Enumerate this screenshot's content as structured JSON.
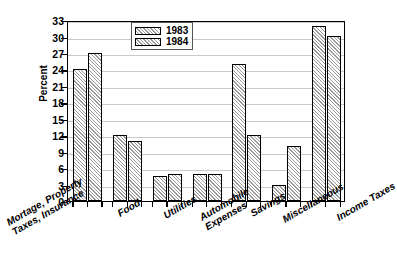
{
  "chart_data": {
    "type": "bar",
    "title": "",
    "xlabel": "",
    "ylabel": "Percent",
    "ylim": [
      0,
      33
    ],
    "yticks": [
      0,
      3,
      6,
      9,
      12,
      15,
      18,
      21,
      24,
      27,
      30,
      33
    ],
    "grid": true,
    "legend_position": "top-center",
    "categories": [
      "Mortage, Property Taxes, Insurance",
      "Food",
      "Utilities",
      "Automobile Expenses",
      "Savings",
      "Miscellaneous",
      "Income Taxes"
    ],
    "category_lines": [
      [
        "Mortage, Property",
        "Taxes, Insurance"
      ],
      [
        "Food",
        ""
      ],
      [
        "Utilities",
        ""
      ],
      [
        "Automobile",
        "Expenses"
      ],
      [
        "Savings",
        ""
      ],
      [
        "Miscellaneous",
        ""
      ],
      [
        "Income Taxes",
        ""
      ]
    ],
    "series": [
      {
        "name": "1983",
        "values": [
          24,
          12,
          4.5,
          5,
          25,
          3,
          32
        ]
      },
      {
        "name": "1984",
        "values": [
          27,
          11,
          5,
          5,
          12.1,
          10,
          30.1
        ]
      }
    ]
  },
  "legend": {
    "entries": [
      {
        "label": "1983"
      },
      {
        "label": "1984"
      }
    ]
  },
  "caption": {
    "text": ""
  }
}
